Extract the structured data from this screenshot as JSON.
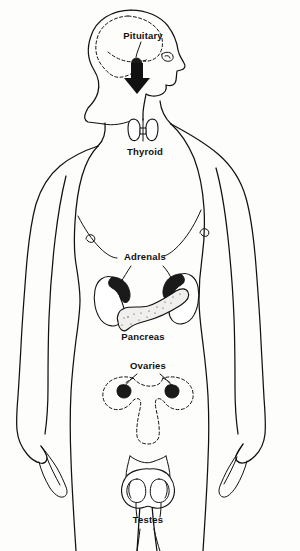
{
  "diagram": {
    "background_color": "#fdfdfc",
    "line_color": "#111111",
    "labels": [
      {
        "id": "pituitary",
        "text": "Pituitary",
        "x": 143,
        "y": 39,
        "organ": "pituitary-gland",
        "pointer": "arrow-down"
      },
      {
        "id": "thyroid",
        "text": "Thyroid",
        "x": 145,
        "y": 155,
        "organ": "thyroid-gland",
        "pointer": "none"
      },
      {
        "id": "adrenals",
        "text": "Adrenals",
        "x": 145,
        "y": 260,
        "organ": "adrenal-glands",
        "pointer": "two-leader-lines"
      },
      {
        "id": "pancreas",
        "text": "Pancreas",
        "x": 143,
        "y": 340,
        "organ": "pancreas",
        "pointer": "none"
      },
      {
        "id": "ovaries",
        "text": "Ovaries",
        "x": 148,
        "y": 369,
        "organ": "ovaries",
        "pointer": "two-leader-lines"
      },
      {
        "id": "testes",
        "text": "Testes",
        "x": 148,
        "y": 523,
        "organ": "testes",
        "pointer": "two-leader-lines"
      }
    ],
    "organs": [
      {
        "id": "brain",
        "name": "brain-outline",
        "style": "dashed"
      },
      {
        "id": "pituitary",
        "name": "pituitary-gland",
        "style": "solid-dark"
      },
      {
        "id": "thyroid",
        "name": "thyroid-gland",
        "style": "outline"
      },
      {
        "id": "kidneys",
        "name": "kidneys",
        "style": "outline"
      },
      {
        "id": "adrenals",
        "name": "adrenal-glands",
        "style": "solid-dark"
      },
      {
        "id": "pancreas",
        "name": "pancreas",
        "style": "stippled"
      },
      {
        "id": "uterus",
        "name": "uterus-and-fallopian-tubes",
        "style": "dashed"
      },
      {
        "id": "ovaries",
        "name": "ovaries",
        "style": "solid-dark"
      },
      {
        "id": "testes",
        "name": "testes-and-scrotum",
        "style": "outline"
      }
    ]
  }
}
